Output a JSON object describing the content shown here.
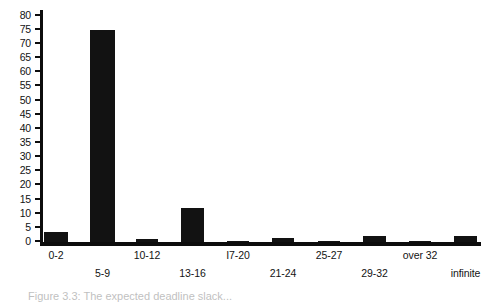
{
  "caption": "Figure 3.3: The expected deadline slack...",
  "chart_data": {
    "type": "bar",
    "title": "",
    "xlabel": "",
    "ylabel": "",
    "ylim": [
      0,
      82
    ],
    "yticks": [
      0,
      5,
      10,
      15,
      20,
      25,
      30,
      35,
      40,
      45,
      50,
      55,
      60,
      65,
      70,
      75,
      80
    ],
    "ytick_labels": [
      "0",
      "5",
      "10",
      "15",
      "20",
      "25",
      "30",
      "35",
      "40",
      "45",
      "50",
      "55",
      "60",
      "65",
      "70",
      "75",
      "80"
    ],
    "grid": false,
    "legend": null,
    "bar_color": "#121212",
    "background_color": "#ffffff",
    "categories": [
      "0-2",
      "5-9",
      "10-12",
      "13-16",
      "I7-20",
      "21-24",
      "25-27",
      "29-32",
      "over 32",
      "infinite"
    ],
    "values": [
      3.5,
      75,
      1,
      12,
      0.3,
      1.5,
      0.3,
      2,
      0.3,
      2
    ],
    "label_rows": [
      "top",
      "bottom",
      "top",
      "bottom",
      "top",
      "bottom",
      "top",
      "bottom",
      "top",
      "bottom"
    ],
    "bars": [
      {
        "label": "0-2",
        "value": 3.5,
        "x": 4,
        "width": 24,
        "row": "top"
      },
      {
        "label": "5-9",
        "value": 75,
        "x": 50,
        "width": 25,
        "row": "bottom"
      },
      {
        "label": "10-12",
        "value": 1,
        "x": 96,
        "width": 22,
        "row": "top"
      },
      {
        "label": "13-16",
        "value": 12,
        "x": 141,
        "width": 23,
        "row": "bottom"
      },
      {
        "label": "I7-20",
        "value": 0.3,
        "x": 187,
        "width": 22,
        "row": "top"
      },
      {
        "label": "21-24",
        "value": 1.5,
        "x": 232,
        "width": 22,
        "row": "bottom"
      },
      {
        "label": "25-27",
        "value": 0.3,
        "x": 278,
        "width": 22,
        "row": "top"
      },
      {
        "label": "29-32",
        "value": 2,
        "x": 323,
        "width": 23,
        "row": "bottom"
      },
      {
        "label": "over 32",
        "value": 0.3,
        "x": 369,
        "width": 22,
        "row": "top"
      },
      {
        "label": "infinite",
        "value": 2,
        "x": 414,
        "width": 23,
        "row": "bottom"
      }
    ]
  }
}
